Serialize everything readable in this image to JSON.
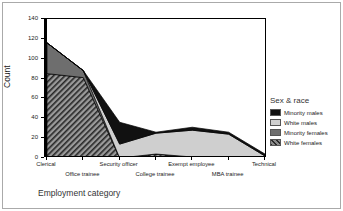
{
  "chart_data": {
    "type": "area",
    "title": "",
    "xlabel": "Employment category",
    "ylabel": "Count",
    "ylim": [
      0,
      140
    ],
    "yticks": [
      0,
      20,
      40,
      60,
      80,
      100,
      120,
      140
    ],
    "grid": false,
    "stacked": true,
    "legend_position": "right",
    "legend_title": "Sex & race",
    "categories": [
      "Clerical",
      "Office trainee",
      "Security officer",
      "College trainee",
      "Exempt employee",
      "MBA trainee",
      "Technical"
    ],
    "series": [
      {
        "name": "White females",
        "values": [
          85,
          81,
          0,
          4,
          1,
          0,
          0
        ],
        "color": "#8a8a8a",
        "pattern": "diagonal-hatch"
      },
      {
        "name": "Minority females",
        "values": [
          31,
          7,
          0,
          0,
          0,
          0,
          0
        ],
        "color": "#6e6e6e",
        "pattern": "solid"
      },
      {
        "name": "White males",
        "values": [
          0,
          0,
          14,
          21,
          27,
          24,
          2
        ],
        "color": "#cfcfcf",
        "pattern": "solid"
      },
      {
        "name": "Minority males",
        "values": [
          0,
          0,
          22,
          1,
          3,
          2,
          2
        ],
        "color": "#111111",
        "pattern": "solid"
      }
    ],
    "stack_totals": [
      116,
      88,
      36,
      26,
      31,
      26,
      4
    ],
    "annotations": []
  },
  "axes": {
    "y_title": "Count",
    "x_title": "Employment category",
    "y_tick_labels": [
      "0",
      "20",
      "40",
      "60",
      "80",
      "100",
      "120",
      "140"
    ],
    "x_tick_labels": [
      "Clerical",
      "Office trainee",
      "Security officer",
      "College trainee",
      "Exempt employee",
      "MBA trainee",
      "Technical"
    ]
  },
  "legend": {
    "title": "Sex & race",
    "items": [
      {
        "label": "Minority males",
        "swatch": "black-swatch"
      },
      {
        "label": "White males",
        "swatch": "light-gray-swatch"
      },
      {
        "label": "Minority females",
        "swatch": "dark-gray-swatch"
      },
      {
        "label": "White females",
        "swatch": "hatched-swatch"
      }
    ]
  }
}
